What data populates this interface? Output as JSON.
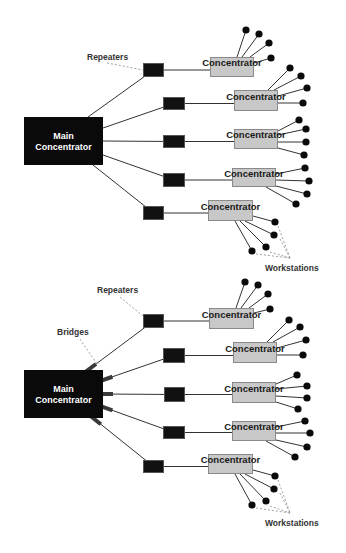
{
  "colors": {
    "background": "#ffffff",
    "main_box": "#0a0a0a",
    "repeater_fill": "#111111",
    "repeater_stroke": "#555555",
    "concentrator_fill": "#c8c8c8",
    "concentrator_stroke": "#8a8a8a",
    "line": "#333333",
    "workstation": "#0a0a0a",
    "bridge": "#3a3a3a",
    "dash": "#888888",
    "label": "#333333"
  },
  "labels": {
    "main_line1": "Main",
    "main_line2": "Concentrator",
    "concentrator": "Concentrator",
    "repeaters": "Repeaters",
    "bridges": "Bridges",
    "workstations": "Workstations"
  },
  "diagrams": [
    {
      "id": "without-bridges",
      "main": {
        "x": 24,
        "y": 117,
        "w": 79,
        "h": 48
      },
      "has_bridges": false,
      "branches": [
        {
          "start": [
            88,
            117
          ],
          "repeater": {
            "x": 143,
            "y": 63,
            "w": 21,
            "h": 14
          },
          "conc": {
            "x": 210,
            "y": 57,
            "w": 44,
            "h": 20
          },
          "ws": [
            [
              246,
              30,
              237,
              57
            ],
            [
              259,
              34,
              242,
              57
            ],
            [
              269,
              43,
              250,
              57
            ],
            [
              271,
              58,
              254,
              63
            ]
          ]
        },
        {
          "start": [
            103,
            128
          ],
          "repeater": {
            "x": 163,
            "y": 97,
            "w": 22,
            "h": 13
          },
          "conc": {
            "x": 234,
            "y": 90,
            "w": 44,
            "h": 21
          },
          "ws": [
            [
              290,
              68,
              268,
              90
            ],
            [
              301,
              76,
              274,
              90
            ],
            [
              307,
              88,
              278,
              96
            ],
            [
              303,
              103,
              278,
              103
            ]
          ]
        },
        {
          "start": [
            103,
            141
          ],
          "repeater": {
            "x": 163,
            "y": 135,
            "w": 22,
            "h": 13
          },
          "conc": {
            "x": 234,
            "y": 129,
            "w": 44,
            "h": 20
          },
          "ws": [
            [
              299,
              120,
              278,
              131
            ],
            [
              306,
              129,
              278,
              135
            ],
            [
              306,
              142,
              278,
              142
            ],
            [
              304,
              155,
              278,
              148
            ]
          ]
        },
        {
          "start": [
            103,
            155
          ],
          "repeater": {
            "x": 163,
            "y": 173,
            "w": 22,
            "h": 14
          },
          "conc": {
            "x": 232,
            "y": 168,
            "w": 44,
            "h": 19
          },
          "ws": [
            [
              305,
              168,
              276,
              174
            ],
            [
              309,
              181,
              276,
              180
            ],
            [
              307,
              194,
              276,
              186
            ],
            [
              296,
              204,
              266,
              187
            ]
          ]
        },
        {
          "start": [
            93,
            165
          ],
          "repeater": {
            "x": 143,
            "y": 206,
            "w": 21,
            "h": 14
          },
          "conc": {
            "x": 208,
            "y": 200,
            "w": 45,
            "h": 21
          },
          "ws": [
            [
              275,
              222,
              253,
              216
            ],
            [
              274,
              235,
              245,
              221
            ],
            [
              266,
              247,
              240,
              221
            ],
            [
              252,
              251,
              235,
              221
            ]
          ]
        }
      ],
      "repeaters_label": {
        "x": 87,
        "y": 60,
        "leader": [
          107,
          63,
          143,
          70
        ]
      },
      "workstations_label": {
        "x": 265,
        "y": 271,
        "apex": [
          290,
          258
        ],
        "from": [
          [
            278,
            226
          ],
          [
            280,
            239
          ],
          [
            270,
            252
          ],
          [
            256,
            254
          ]
        ]
      }
    },
    {
      "id": "with-bridges",
      "main": {
        "x": 24,
        "y": 370,
        "w": 79,
        "h": 48
      },
      "has_bridges": true,
      "branches": [
        {
          "start": [
            88,
            370
          ],
          "repeater": {
            "x": 143,
            "y": 314,
            "w": 21,
            "h": 14
          },
          "conc": {
            "x": 209,
            "y": 308,
            "w": 45,
            "h": 21
          },
          "ws": [
            [
              245,
              282,
              236,
              308
            ],
            [
              258,
              285,
              241,
              308
            ],
            [
              268,
              294,
              249,
              308
            ],
            [
              270,
              309,
              254,
              313
            ]
          ]
        },
        {
          "start": [
            103,
            380
          ],
          "repeater": {
            "x": 163,
            "y": 348,
            "w": 22,
            "h": 15
          },
          "conc": {
            "x": 233,
            "y": 342,
            "w": 44,
            "h": 21
          },
          "ws": [
            [
              289,
              320,
              267,
              342
            ],
            [
              300,
              327,
              273,
              342
            ],
            [
              306,
              340,
              277,
              348
            ],
            [
              303,
              355,
              277,
              355
            ]
          ]
        },
        {
          "start": [
            103,
            394
          ],
          "repeater": {
            "x": 164,
            "y": 387,
            "w": 21,
            "h": 15
          },
          "conc": {
            "x": 232,
            "y": 382,
            "w": 44,
            "h": 21
          },
          "ws": [
            [
              297,
              375,
              276,
              384
            ],
            [
              307,
              386,
              276,
              389
            ],
            [
              307,
              398,
              276,
              396
            ],
            [
              298,
              409,
              276,
              402
            ]
          ]
        },
        {
          "start": [
            103,
            407
          ],
          "repeater": {
            "x": 163,
            "y": 426,
            "w": 22,
            "h": 13
          },
          "conc": {
            "x": 232,
            "y": 421,
            "w": 44,
            "h": 20
          },
          "ws": [
            [
              305,
              421,
              276,
              427
            ],
            [
              310,
              433,
              276,
              433
            ],
            [
              307,
              447,
              276,
              440
            ],
            [
              295,
              457,
              266,
              441
            ]
          ]
        },
        {
          "start": [
            93,
            418
          ],
          "repeater": {
            "x": 143,
            "y": 460,
            "w": 21,
            "h": 13
          },
          "conc": {
            "x": 208,
            "y": 454,
            "w": 45,
            "h": 20
          },
          "ws": [
            [
              275,
              476,
              253,
              470
            ],
            [
              274,
              489,
              245,
              474
            ],
            [
              266,
              501,
              240,
              474
            ],
            [
              252,
              505,
              235,
              474
            ]
          ]
        }
      ],
      "repeaters_label": {
        "x": 97,
        "y": 293,
        "leader": [
          120,
          297,
          143,
          316
        ]
      },
      "bridges_label": {
        "x": 57,
        "y": 335,
        "leader": [
          80,
          339,
          97,
          364
        ]
      },
      "workstations_label": {
        "x": 265,
        "y": 526,
        "apex": [
          290,
          513
        ],
        "from": [
          [
            278,
            480
          ],
          [
            280,
            493
          ],
          [
            270,
            506
          ],
          [
            256,
            508
          ]
        ]
      }
    }
  ]
}
